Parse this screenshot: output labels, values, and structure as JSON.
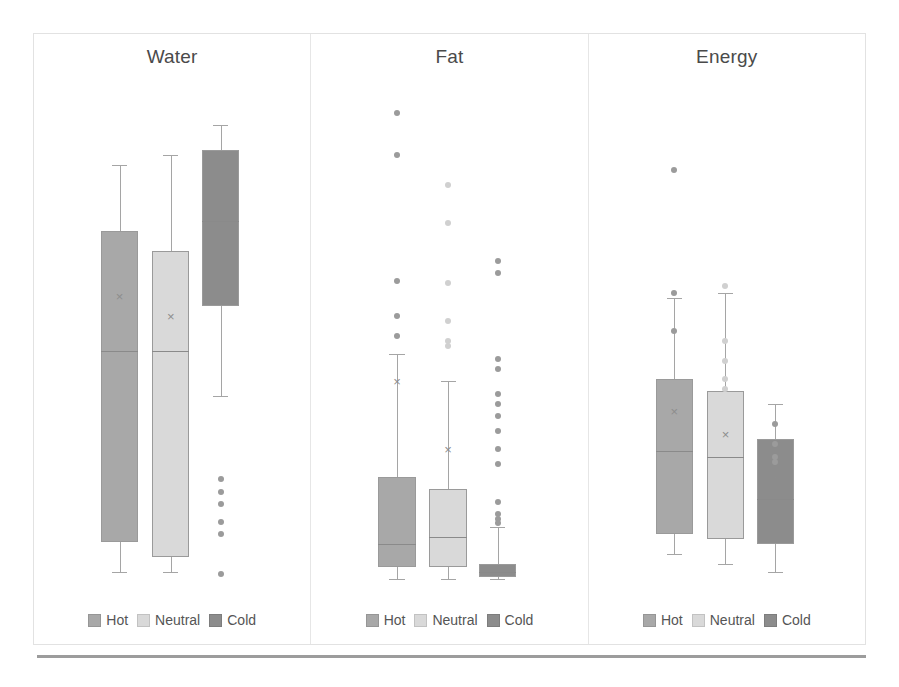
{
  "figure": {
    "panel_divider_color": "#e6e6e6",
    "frame_border_color": "#e2e2e2",
    "baseline_color": "#9c9c9c"
  },
  "legend": {
    "items": [
      {
        "label": "Hot",
        "color": "#a8a8a8"
      },
      {
        "label": "Neutral",
        "color": "#d9d9d9"
      },
      {
        "label": "Cold",
        "color": "#8c8c8c"
      }
    ]
  },
  "chart_data": {
    "type": "box",
    "title": "",
    "xlabel": "",
    "ylabel": "",
    "grid": false,
    "legend_position": "bottom",
    "groups": [
      "Hot",
      "Neutral",
      "Cold"
    ],
    "group_colors": {
      "Hot": "#a8a8a8",
      "Neutral": "#d9d9d9",
      "Cold": "#8c8c8c"
    },
    "panels": [
      {
        "name": "Water",
        "title": "Water",
        "boxes": [
          {
            "group": "Hot",
            "whisker_low": 2.0,
            "q1": 8.0,
            "median": 46.0,
            "q3": 70.0,
            "whisker_high": 83.0,
            "mean": 57.0,
            "outliers": []
          },
          {
            "group": "Neutral",
            "whisker_low": 2.0,
            "q1": 5.0,
            "median": 46.0,
            "q3": 66.0,
            "whisker_high": 85.0,
            "mean": 53.0,
            "outliers": []
          },
          {
            "group": "Cold",
            "whisker_low": 37.0,
            "q1": 55.0,
            "median": 72.0,
            "q3": 86.0,
            "whisker_high": 91.0,
            "mean": 68.0,
            "outliers": [
              20.5,
              18.0,
              15.5,
              12.0,
              9.5,
              1.5
            ]
          }
        ]
      },
      {
        "name": "Fat",
        "title": "Fat",
        "boxes": [
          {
            "group": "Hot",
            "whisker_low": 0.5,
            "q1": 3.0,
            "median": 7.5,
            "q3": 21.0,
            "whisker_high": 45.5,
            "mean": 40.0,
            "outliers": [
              93.5,
              85.0,
              60.0,
              53.0,
              49.0
            ]
          },
          {
            "group": "Neutral",
            "whisker_low": 0.5,
            "q1": 3.0,
            "median": 9.0,
            "q3": 18.5,
            "whisker_high": 40.0,
            "mean": 26.5,
            "outliers": [
              79.0,
              71.5,
              59.5,
              52.0,
              48.0,
              47.0
            ]
          },
          {
            "group": "Cold",
            "whisker_low": 0.5,
            "q1": 1.0,
            "median": 2.0,
            "q3": 3.5,
            "whisker_high": 11.0,
            "mean": 3.0,
            "outliers": [
              64.0,
              61.5,
              44.5,
              42.5,
              37.5,
              35.5,
              33.0,
              30.0,
              26.5,
              23.5,
              16.0,
              13.5,
              12.5,
              11.8
            ]
          }
        ]
      },
      {
        "name": "Energy",
        "title": "Energy",
        "boxes": [
          {
            "group": "Hot",
            "whisker_low": 5.5,
            "q1": 9.5,
            "median": 26.0,
            "q3": 40.5,
            "whisker_high": 56.5,
            "mean": 34.0,
            "outliers": [
              82.0,
              57.5,
              50.0
            ]
          },
          {
            "group": "Neutral",
            "whisker_low": 3.5,
            "q1": 8.5,
            "median": 25.0,
            "q3": 38.0,
            "whisker_high": 57.5,
            "mean": 29.5,
            "outliers": [
              59.0,
              48.0,
              44.0,
              40.5,
              38.5
            ]
          },
          {
            "group": "Cold",
            "whisker_low": 2.0,
            "q1": 7.5,
            "median": 16.5,
            "q3": 28.5,
            "whisker_high": 35.5,
            "mean": 21.0,
            "outliers": [
              31.5,
              27.5,
              25.0,
              24.0
            ]
          }
        ]
      }
    ]
  }
}
